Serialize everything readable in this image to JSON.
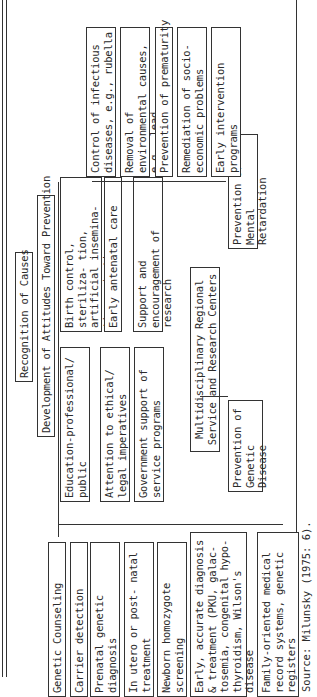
{
  "diagram": {
    "root": "Recognition of Causes",
    "level2": "Development of Attitudes Toward Prevention",
    "societal_measures": [
      "Education-professional/ public",
      "Attention to ethical/ legal imperatives",
      "Government support of service programs"
    ],
    "reproductive_measures": [
      "Birth control, steriliza- tion, artificial insemina- tion, adoption",
      "Early antenatal care",
      "Support and encouragement of research"
    ],
    "center": "Multidisciplinary Regional Service and Research Centers",
    "outcomes": [
      "Prevention of Genetic Disease",
      "Prevention of Mental Retardation"
    ],
    "genetic_branch": [
      "Genetic Counseling",
      "Carrier detection",
      "Prenatal genetic diagnosis",
      "In utero or post- natal treatment",
      "Newborn homozygote screening",
      "Early, accurate diagnosis & treatment (PKU, galac- tosemia, congenital hypo- thyroidism, Wilson's disease",
      "Family-oriented medical record systems, genetic registers"
    ],
    "retardation_branch": [
      "Control of infectious diseases, e.g., rubella",
      "Removal of environmental causes, e.g., lead",
      "Prevention of prematurity",
      "Remediation of socio- economic problems",
      "Early intervention programs"
    ],
    "source": "Source: Milunsky (1975: 6)."
  }
}
